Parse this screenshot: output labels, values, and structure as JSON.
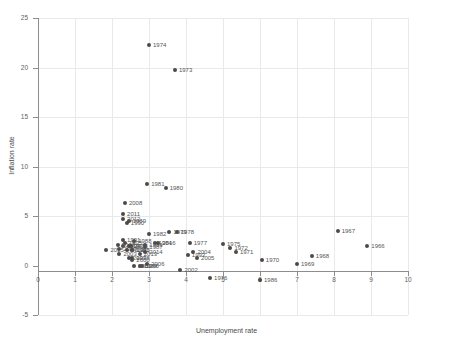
{
  "chart_data": {
    "type": "scatter",
    "title": "",
    "xlabel": "Unemployment rate",
    "ylabel": "Inflation rate",
    "xlim": [
      0,
      10
    ],
    "ylim": [
      -5,
      25
    ],
    "xticks": [
      0,
      1,
      2,
      3,
      4,
      5,
      6,
      7,
      8,
      9,
      10
    ],
    "yticks": [
      -5,
      0,
      5,
      10,
      15,
      20,
      25
    ],
    "grid": true,
    "legend": "none",
    "point_color": "#4a4a4a",
    "points": [
      {
        "label": "1966",
        "x": 8.9,
        "y": 2.0
      },
      {
        "label": "1967",
        "x": 8.1,
        "y": 3.5
      },
      {
        "label": "1968",
        "x": 7.4,
        "y": 1.0
      },
      {
        "label": "1969",
        "x": 7.0,
        "y": 0.2
      },
      {
        "label": "1970",
        "x": 6.05,
        "y": 0.6
      },
      {
        "label": "1971",
        "x": 5.35,
        "y": 1.4
      },
      {
        "label": "1972",
        "x": 5.2,
        "y": 1.8
      },
      {
        "label": "1973",
        "x": 3.7,
        "y": 19.7
      },
      {
        "label": "1974",
        "x": 3.0,
        "y": 22.3
      },
      {
        "label": "1975",
        "x": 5.0,
        "y": 2.2
      },
      {
        "label": "1976",
        "x": 4.65,
        "y": -1.3
      },
      {
        "label": "1977",
        "x": 4.1,
        "y": 2.3
      },
      {
        "label": "1978",
        "x": 3.75,
        "y": 3.4
      },
      {
        "label": "1979",
        "x": 3.55,
        "y": 3.4
      },
      {
        "label": "1980",
        "x": 3.45,
        "y": 7.8
      },
      {
        "label": "1981",
        "x": 2.95,
        "y": 8.2
      },
      {
        "label": "1982",
        "x": 3.0,
        "y": 3.2
      },
      {
        "label": "1983",
        "x": 2.9,
        "y": 2.1
      },
      {
        "label": "1984",
        "x": 3.15,
        "y": 2.3
      },
      {
        "label": "1985",
        "x": 2.55,
        "y": 1.6
      },
      {
        "label": "1986",
        "x": 6.0,
        "y": -1.5
      },
      {
        "label": "1987",
        "x": 2.9,
        "y": 1.9
      },
      {
        "label": "1988",
        "x": 2.6,
        "y": 2.5
      },
      {
        "label": "1989",
        "x": 2.45,
        "y": 4.5
      },
      {
        "label": "1990",
        "x": 2.4,
        "y": 4.3
      },
      {
        "label": "1991",
        "x": 2.3,
        "y": 2.6
      },
      {
        "label": "1992",
        "x": 2.55,
        "y": 1.6
      },
      {
        "label": "1993",
        "x": 4.05,
        "y": 1.1
      },
      {
        "label": "1994",
        "x": 2.3,
        "y": 2.0
      },
      {
        "label": "1995",
        "x": 2.35,
        "y": 2.3
      },
      {
        "label": "1996",
        "x": 2.8,
        "y": -0.1
      },
      {
        "label": "1997",
        "x": 2.45,
        "y": 2.0
      },
      {
        "label": "1998",
        "x": 2.55,
        "y": 0.8
      },
      {
        "label": "1999",
        "x": 2.75,
        "y": -0.1
      },
      {
        "label": "2000",
        "x": 2.55,
        "y": 0.6
      },
      {
        "label": "2001",
        "x": 2.6,
        "y": -0.1
      },
      {
        "label": "2002",
        "x": 3.85,
        "y": -0.5
      },
      {
        "label": "2003",
        "x": 2.2,
        "y": 1.2
      },
      {
        "label": "2004",
        "x": 4.2,
        "y": 1.4
      },
      {
        "label": "2005",
        "x": 4.3,
        "y": 0.8
      },
      {
        "label": "2006",
        "x": 2.95,
        "y": 0.2
      },
      {
        "label": "2007",
        "x": 2.45,
        "y": 0.8
      },
      {
        "label": "2008",
        "x": 2.35,
        "y": 6.3
      },
      {
        "label": "2009",
        "x": 2.2,
        "y": 1.7
      },
      {
        "label": "2010",
        "x": 2.4,
        "y": 1.6
      },
      {
        "label": "2011",
        "x": 2.3,
        "y": 5.2
      },
      {
        "label": "2012",
        "x": 2.3,
        "y": 4.7
      },
      {
        "label": "2013",
        "x": 2.75,
        "y": 1.2
      },
      {
        "label": "2014",
        "x": 2.9,
        "y": 1.4
      },
      {
        "label": "2015",
        "x": 1.85,
        "y": 1.6
      },
      {
        "label": "2016",
        "x": 3.25,
        "y": 2.3
      },
      {
        "label": "2017",
        "x": 2.15,
        "y": 2.1
      },
      {
        "label": "2018",
        "x": 2.5,
        "y": 2.0
      }
    ]
  }
}
